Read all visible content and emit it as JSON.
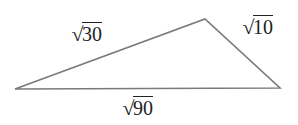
{
  "diagram": {
    "type": "triangle",
    "vertices": {
      "left": [
        15,
        89
      ],
      "top": [
        205,
        19
      ],
      "right": [
        280,
        88
      ]
    },
    "stroke_color": "#7a7a7a",
    "sides": [
      {
        "id": "left-top",
        "radical": "√",
        "value": "30"
      },
      {
        "id": "top-right",
        "radical": "√",
        "value": "10"
      },
      {
        "id": "bottom",
        "radical": "√",
        "value": "90"
      }
    ]
  }
}
